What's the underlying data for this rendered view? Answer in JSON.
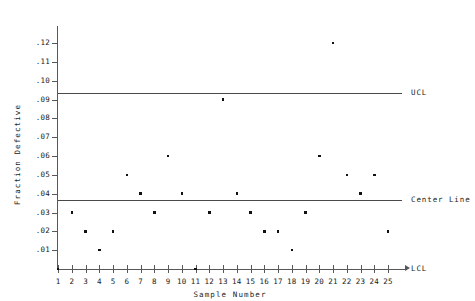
{
  "chart_data": {
    "type": "scatter",
    "title": "",
    "xlabel": "Sample Number",
    "ylabel": "Fraction Defective",
    "x": [
      1,
      2,
      3,
      4,
      5,
      6,
      7,
      8,
      9,
      10,
      11,
      12,
      13,
      14,
      15,
      16,
      17,
      18,
      19,
      20,
      21,
      22,
      23,
      24,
      25
    ],
    "values": [
      0.0,
      0.03,
      0.02,
      0.01,
      0.02,
      0.05,
      0.04,
      0.03,
      0.06,
      0.04,
      0.0,
      0.03,
      0.09,
      0.04,
      0.03,
      0.02,
      0.02,
      0.01,
      0.03,
      0.06,
      0.12,
      0.05,
      0.04,
      0.05,
      0.02
    ],
    "xtick_labels": [
      "1",
      "2",
      "3",
      "4",
      "5",
      "6",
      "7",
      "8",
      "9",
      "10",
      "11",
      "12",
      "13",
      "14",
      "15",
      "16",
      "17",
      "18",
      "19",
      "20",
      "21",
      "22",
      "23",
      "24",
      "25"
    ],
    "ytick_labels": [
      ".01",
      ".02",
      ".03",
      ".04",
      ".05",
      ".06",
      ".07",
      ".08",
      ".09",
      ".10",
      ".11",
      ".12"
    ],
    "ytick_values": [
      0.01,
      0.02,
      0.03,
      0.04,
      0.05,
      0.06,
      0.07,
      0.08,
      0.09,
      0.1,
      0.11,
      0.12
    ],
    "ylim": [
      0.0,
      0.127
    ],
    "xlim": [
      0.4,
      25.6
    ],
    "grid": false,
    "legend": "none",
    "marker_color": "#111111",
    "line_color": "#4a4a4c",
    "control_limits": [
      {
        "name": "UCL",
        "label": "UCL",
        "value": 0.0935
      },
      {
        "name": "center-line",
        "label": "Center Line",
        "value": 0.0367
      },
      {
        "name": "LCL",
        "label": "LCL",
        "value": 0.0
      }
    ]
  }
}
